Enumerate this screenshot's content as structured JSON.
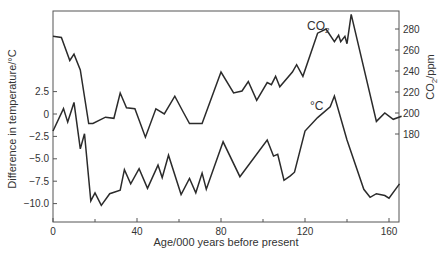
{
  "chart_data": {
    "type": "line",
    "title": "",
    "xlabel": "Age/000 years before present",
    "ylabel_left": "Difference in temperature/°C",
    "ylabel_right": "CO2/ppm",
    "xlim": [
      0,
      166
    ],
    "x_ticks": [
      0,
      40,
      80,
      120,
      160
    ],
    "x_minor_ticks": [
      20,
      60,
      100,
      140
    ],
    "y_left_ticks": [
      2.5,
      0,
      -2.5,
      -5.0,
      -7.5,
      -10.0
    ],
    "y_left_tick_labels": [
      "2.5",
      "0",
      "−2.5",
      "−5.0",
      "−7.5",
      "−10.0"
    ],
    "y_right_ticks": [
      280,
      260,
      240,
      220,
      200,
      180
    ],
    "y_right_tick_labels": [
      "280",
      "260",
      "240",
      "220",
      "200",
      "180"
    ],
    "grid": false,
    "legend": "inline labels",
    "series": [
      {
        "name": "CO2",
        "label": "CO2",
        "axis": "right",
        "unit": "ppm",
        "x": [
          0,
          4,
          8,
          10,
          13,
          17,
          19,
          25,
          29,
          32,
          35,
          39,
          44,
          49,
          53,
          58,
          62,
          65,
          71,
          80,
          86,
          90,
          93,
          97,
          102,
          104,
          106,
          108,
          114,
          116,
          119,
          126,
          130,
          134,
          136,
          137,
          139,
          140,
          142,
          154,
          158,
          162,
          166
        ],
        "values": [
          273,
          272,
          250,
          256,
          241,
          190,
          190,
          196,
          195,
          219,
          205,
          204,
          177,
          204,
          199,
          216,
          201,
          190,
          190,
          239,
          219,
          221,
          230,
          212,
          229,
          227,
          235,
          225,
          239,
          246,
          235,
          276,
          280,
          268,
          274,
          268,
          273,
          266,
          294,
          192,
          200,
          194,
          197
        ]
      },
      {
        "name": "Temperature",
        "label": "°C",
        "axis": "left",
        "unit": "°C",
        "x": [
          0,
          5,
          7,
          10,
          13,
          15,
          18,
          20,
          23,
          27,
          32,
          34,
          37,
          41,
          45,
          50,
          52,
          55,
          61,
          65,
          68,
          71,
          73,
          81,
          89,
          102,
          105,
          107,
          110,
          113,
          115,
          120,
          126,
          132,
          134,
          140,
          148,
          151,
          154,
          158,
          160,
          165
        ],
        "values": [
          -1.9,
          0.6,
          -0.9,
          1.3,
          -3.9,
          -2.2,
          -9.7,
          -8.8,
          -10.2,
          -8.9,
          -8.5,
          -6.2,
          -7.8,
          -6.1,
          -8.3,
          -5.7,
          -7.1,
          -4.6,
          -9.0,
          -7.2,
          -8.8,
          -6.6,
          -8.4,
          -3.1,
          -7.0,
          -2.9,
          -4.7,
          -4.5,
          -7.4,
          -6.9,
          -6.5,
          -1.9,
          -0.4,
          0.8,
          2.0,
          -2.9,
          -8.4,
          -9.3,
          -8.9,
          -9.1,
          -9.4,
          -7.8
        ]
      }
    ],
    "annotations": [
      {
        "text": "CO2",
        "near_x": 128,
        "series": "CO2"
      },
      {
        "text": "°C",
        "near_x": 123,
        "series": "Temperature"
      }
    ]
  },
  "labels": {
    "xlabel": "Age/000 years before present",
    "ylabel_left": "Difference in temperature/°C",
    "ylabel_right_prefix": "CO",
    "ylabel_right_sub": "2",
    "ylabel_right_suffix": "/ppm",
    "co2_label_prefix": "CO",
    "co2_label_sub": "2",
    "temp_label": "°C"
  }
}
